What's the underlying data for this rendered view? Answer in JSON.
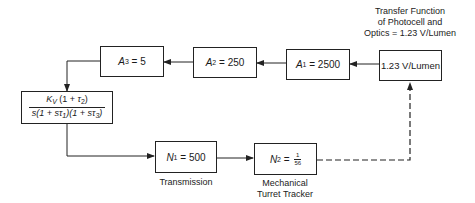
{
  "diagram": {
    "title": "Transfer Function of Photocell and Optics = 1.23 V/Lumen",
    "title_lines": [
      "Transfer Function",
      "of Photocell and",
      "Optics = 1.23 V/Lumen"
    ],
    "blocks": {
      "photocell": {
        "text": "1.23 V/Lumen"
      },
      "a1": {
        "symbol": "A",
        "subscript": "1",
        "eq": " = 2500"
      },
      "a2": {
        "symbol": "A",
        "subscript": "2",
        "eq": " = 250"
      },
      "a3": {
        "symbol": "A",
        "subscript": "3",
        "eq": " = 5"
      },
      "controller": {
        "numerator": "K_V (1 + τ_2)",
        "numerator_parts": {
          "k": "K",
          "k_sub": "V",
          "rest_a": " (1 + ",
          "tau": "τ",
          "tau_sub": "2",
          "rest_b": ")"
        },
        "denominator": "s(1 + sτ_1)(1 + sτ_3)",
        "denominator_parts": {
          "a": "s(1 + s",
          "tau1": "τ",
          "tau1_sub": "1",
          "b": ")(1 + s",
          "tau3": "τ",
          "tau3_sub": "3",
          "c": ")"
        }
      },
      "n1": {
        "symbol": "N",
        "subscript": "1",
        "eq": " = 500",
        "caption": "Transmission"
      },
      "n2": {
        "symbol": "N",
        "subscript": "2",
        "eq": " = ",
        "frac_num": "1",
        "frac_den": "56",
        "caption_lines": [
          "Mechanical",
          "Turret Tracker"
        ]
      }
    },
    "connections": [
      {
        "from": "photocell",
        "to": "a1",
        "style": "solid"
      },
      {
        "from": "a1",
        "to": "a2",
        "style": "solid"
      },
      {
        "from": "a2",
        "to": "a3",
        "style": "solid"
      },
      {
        "from": "a3",
        "to": "controller",
        "style": "solid"
      },
      {
        "from": "controller",
        "to": "n1",
        "style": "solid"
      },
      {
        "from": "n1",
        "to": "n2",
        "style": "solid"
      },
      {
        "from": "n2",
        "to": "photocell",
        "style": "dashed"
      }
    ]
  }
}
